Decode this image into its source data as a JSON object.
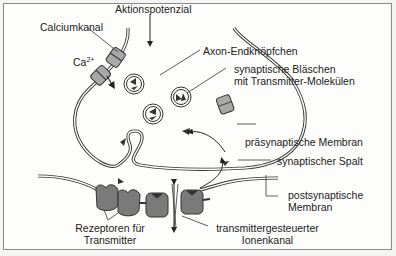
{
  "diagram": {
    "labels": {
      "aktionspotenzial": "Aktionspotenzial",
      "calciumkanal": "Calciumkanal",
      "ca": "Ca",
      "ca_charge": "2+",
      "axon_endknoepfchen": "Axon-Endknöpfchen",
      "blaeschen_line1": "synaptische Bläschen",
      "blaeschen_line2": "mit Transmitter-Molekülen",
      "praesynaptische_membran": "präsynaptische Membran",
      "synaptischer_spalt": "synaptischer Spalt",
      "postsynaptische_line1": "postsynaptische",
      "postsynaptische_line2": "Membran",
      "rezeptoren_line1": "Rezeptoren für",
      "rezeptoren_line2": "Transmitter",
      "ionenkanal_line1": "transmittergesteuerter",
      "ionenkanal_line2": "Ionenkanal"
    },
    "colors": {
      "background": "#fdfdfb",
      "stroke": "#333333",
      "channel_fill": "#a8a8a8",
      "receptor_fill": "#7a7a7a",
      "frame": "#8a8a8a"
    }
  }
}
